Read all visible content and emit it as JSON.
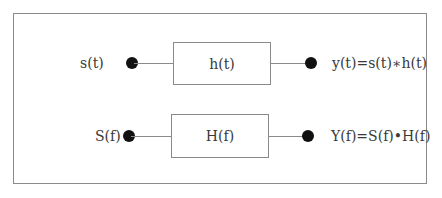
{
  "diagram": {
    "rows": [
      {
        "domain": "time",
        "input_label": "s(t)",
        "system_label": "h(t)",
        "output_label": "y(t)=s(t)∗h(t)"
      },
      {
        "domain": "frequency",
        "input_label": "S(f)",
        "system_label": "H(f)",
        "output_label": "Y(f)=S(f)•H(f)"
      }
    ],
    "colors": {
      "line": "#8a8a8a",
      "dot": "#111111",
      "text": "#3a3a3a"
    }
  }
}
